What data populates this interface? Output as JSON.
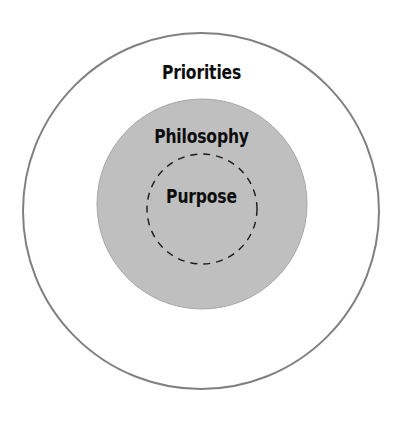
{
  "diagram": {
    "type": "concentric-circles",
    "title": "",
    "background_color": "#FFFFFF",
    "canvas": {
      "width": 403,
      "height": 426
    },
    "rings": [
      {
        "id": "outer",
        "label": "Priorities",
        "fill_color": "#FFFFFF",
        "stroke_color": "#808080",
        "stroke_width": 2,
        "stroke_style": "solid",
        "center_x": 201,
        "center_y": 211,
        "radius": 178,
        "label_color": "#0D0D0D",
        "label_y": 63
      },
      {
        "id": "middle",
        "label": "Philosophy",
        "fill_color": "#BFBFBF",
        "stroke_color": "#A6A6A6",
        "stroke_width": 1,
        "stroke_style": "solid",
        "center_x": 202,
        "center_y": 204,
        "radius": 105,
        "label_color": "#0D0D0D",
        "label_y": 127
      },
      {
        "id": "inner",
        "label": "Purpose",
        "fill_color": "none",
        "stroke_color": "#1A1A1A",
        "stroke_width": 1.4,
        "stroke_style": "dashed",
        "dash_pattern": "7 6",
        "center_x": 202,
        "center_y": 209,
        "radius": 55,
        "label_color": "#0D0D0D",
        "label_y": 187
      }
    ]
  }
}
